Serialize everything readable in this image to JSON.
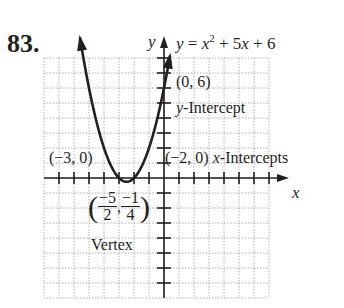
{
  "problem": {
    "number": "83."
  },
  "chart_data": {
    "type": "line",
    "equation": {
      "lhs": "y",
      "rhs_before_exp": "x",
      "exponent": "2",
      "rhs_after": "+ 5x + 6"
    },
    "xlabel": "x",
    "ylabel": "y",
    "xlim": [
      -8,
      7
    ],
    "ylim": [
      -8,
      8
    ],
    "grid": true,
    "tick_spacing": 1,
    "curve": {
      "a": 1,
      "b": 5,
      "c": 6,
      "x_from": -5.6,
      "x_to": 0.4
    },
    "annotations": [
      {
        "point": [
          0,
          6
        ],
        "label": "(0, 6)",
        "caption": "y-Intercept"
      },
      {
        "point": [
          -3,
          0
        ],
        "label": "(−3, 0)"
      },
      {
        "point": [
          -2,
          0
        ],
        "label": "(−2, 0)",
        "caption": "x-Intercepts"
      },
      {
        "point": [
          -2.5,
          -0.25
        ],
        "label": "(−5/2, −1/4)",
        "caption": "Vertex"
      }
    ]
  },
  "labels": {
    "y_axis": "y",
    "x_axis": "x",
    "eq_y": "y",
    "eq_eq": " = ",
    "eq_x": "x",
    "eq_exp": "2",
    "eq_rest": " + 5",
    "eq_x2": "x",
    "eq_tail": " + 6",
    "y_int_point": "(0, 6)",
    "y_int_y": "y",
    "y_int_text": "-Intercept",
    "x_int_left": "(−3, 0)",
    "x_int_right": "(−2, 0) ",
    "x_int_x": "x",
    "x_int_text": "-Intercepts",
    "vertex_num1": "−5",
    "vertex_den1": "2",
    "vertex_num2": "−1",
    "vertex_den2": "4",
    "vertex_text": "Vertex"
  }
}
